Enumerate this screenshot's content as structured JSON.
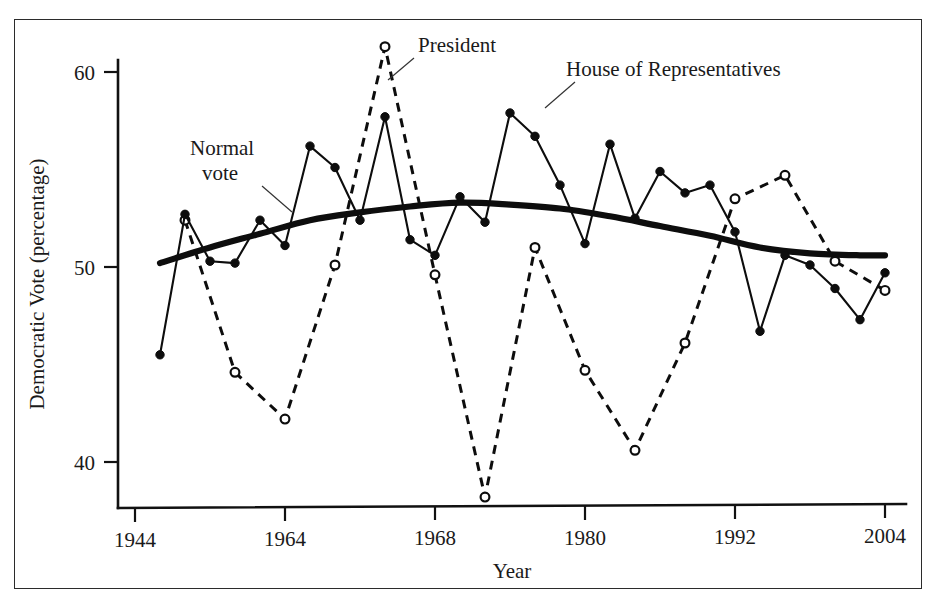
{
  "figure": {
    "background_color": "#ffffff",
    "ink_color": "#0d0d0d",
    "frame_color": "#2b2b2b"
  },
  "annotations": {
    "president": "President",
    "house": "House of Representatives",
    "normal_line1": "Normal",
    "normal_line2": "vote"
  },
  "axes": {
    "xlabel": "Year",
    "ylabel": "Democratic Vote (percentage)",
    "x_ticklabels": [
      "1944",
      "1964",
      "1968",
      "1980",
      "1992",
      "2004"
    ],
    "y_ticklabels": [
      "40",
      "50",
      "60"
    ]
  },
  "chart_data": {
    "type": "line",
    "title": "",
    "xlabel": "Year",
    "ylabel": "Democratic Vote (percentage)",
    "xlim": [
      1944,
      2004
    ],
    "ylim": [
      36.5,
      62.5
    ],
    "x_tick_values": [
      1944,
      1964,
      1968,
      1980,
      1992,
      2004
    ],
    "x_tick_labels": [
      "1944",
      "1964",
      "1968",
      "1980",
      "1992",
      "2004"
    ],
    "y_tick_values": [
      40,
      50,
      60
    ],
    "y_tick_labels": [
      "40",
      "50",
      "60"
    ],
    "grid": false,
    "legend_position": "inline-annotations",
    "series": [
      {
        "name": "House of Representatives",
        "style": "solid",
        "marker": "filled-circle",
        "x": [
          1946,
          1948,
          1950,
          1952,
          1954,
          1956,
          1958,
          1960,
          1962,
          1964,
          1966,
          1968,
          1970,
          1972,
          1974,
          1976,
          1978,
          1980,
          1982,
          1984,
          1986,
          1988,
          1990,
          1992,
          1994,
          1996,
          1998,
          2000,
          2002,
          2004
        ],
        "values": [
          45.5,
          52.7,
          50.3,
          50.2,
          52.4,
          51.1,
          56.2,
          55.1,
          52.4,
          57.7,
          51.4,
          50.6,
          53.6,
          52.3,
          57.9,
          56.7,
          54.2,
          51.2,
          56.3,
          52.5,
          54.9,
          53.8,
          54.2,
          51.8,
          46.7,
          50.6,
          50.1,
          48.9,
          47.3,
          49.7
        ]
      },
      {
        "name": "President",
        "style": "dashed",
        "marker": "open-circle",
        "x": [
          1948,
          1952,
          1956,
          1960,
          1964,
          1968,
          1972,
          1976,
          1980,
          1984,
          1988,
          1992,
          1996,
          2000,
          2004
        ],
        "values": [
          52.4,
          44.6,
          42.2,
          50.1,
          61.3,
          49.6,
          38.2,
          51.0,
          44.7,
          40.6,
          46.1,
          53.5,
          54.7,
          50.3,
          48.8
        ]
      },
      {
        "name": "Normal vote",
        "style": "thick-smooth",
        "marker": "none",
        "x": [
          1946,
          1950,
          1954,
          1958,
          1962,
          1966,
          1970,
          1974,
          1978,
          1982,
          1986,
          1990,
          1994,
          1998,
          2002,
          2004
        ],
        "values": [
          50.2,
          51.0,
          51.7,
          52.4,
          52.8,
          53.1,
          53.3,
          53.2,
          53.0,
          52.6,
          52.1,
          51.6,
          51.0,
          50.7,
          50.6,
          50.6
        ]
      }
    ]
  }
}
